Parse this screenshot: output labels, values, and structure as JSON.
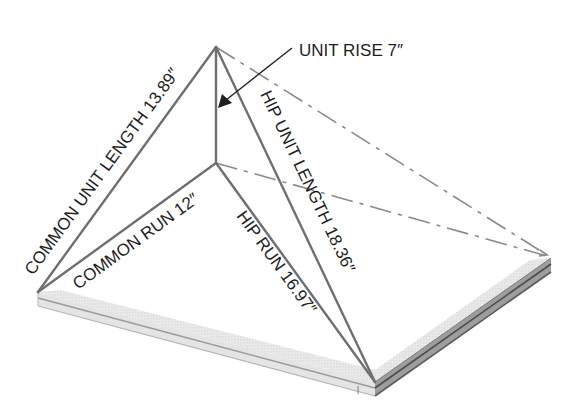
{
  "diagram": {
    "labels": {
      "unit_rise": "UNIT RISE 7″",
      "common_unit_length": "COMMON UNIT LENGTH 13.89″",
      "common_run": "COMMON RUN 12″",
      "hip_run": "HIP RUN 16.97″",
      "hip_unit_length": "HIP UNIT LENGTH 18.36″"
    },
    "values": {
      "unit_rise_in": 7,
      "common_unit_length_in": 13.89,
      "common_run_in": 12,
      "hip_run_in": 16.97,
      "hip_unit_length_in": 18.36
    },
    "points": {
      "apex": [
        216,
        47
      ],
      "plate_center": [
        216,
        163
      ],
      "left_corner": [
        38,
        292
      ],
      "front_corner": [
        375,
        382
      ],
      "right_corner": [
        551,
        258
      ]
    },
    "colors": {
      "edge": "#6f6f6f",
      "hidden": "#8a8a8a",
      "text": "#1e1e1e",
      "plate_top": "#ededed",
      "plate_side": "#cfcfcf"
    }
  }
}
